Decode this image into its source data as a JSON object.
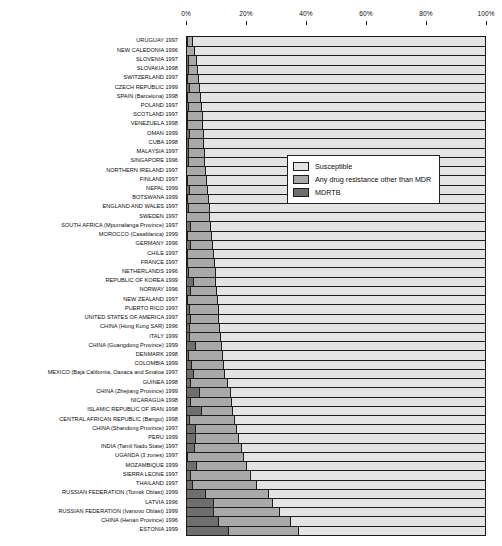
{
  "chart_data": {
    "type": "bar",
    "subtype": "horizontal-stacked-100-percent",
    "title": "",
    "xlabel": "",
    "ylabel": "",
    "xlim": [
      0,
      100
    ],
    "xticks": [
      "0%",
      "20%",
      "40%",
      "60%",
      "80%",
      "100%"
    ],
    "xtick_values": [
      0,
      20,
      40,
      60,
      80,
      100
    ],
    "grid": false,
    "legend_position": "upper-center",
    "series": [
      {
        "name": "Susceptible",
        "color": "#e4e4e4"
      },
      {
        "name": "Any drug resistance other than MDR",
        "color": "#a9a9a9"
      },
      {
        "name": "MDRTB",
        "color": "#6e6e6e"
      }
    ],
    "categories": [
      "URUGUAY 1997",
      "NEW CALEDONIA 1996",
      "SLOVENIA 1997",
      "SLOVAKIA 1998",
      "SWITZERLAND 1997",
      "CZECH REPUBLIC 1999",
      "SPAIN (Barcelona) 1998",
      "POLAND 1997",
      "SCOTLAND 1997",
      "VENEZUELA 1998",
      "OMAN 1999",
      "CUBA 1998",
      "MALAYSIA 1997",
      "SINGAPORE 1996",
      "NORTHERN IRELAND 1997",
      "FINLAND 1997",
      "NEPAL 1999",
      "BOTSWANA 1999",
      "ENGLAND AND WALES 1997",
      "SWEDEN 1997",
      "SOUTH AFRICA (Mpumalanga Province) 1997",
      "MOROCCO (Casablanca) 1999",
      "GERMANY 1996",
      "CHILE 1997",
      "FRANCE 1997",
      "NETHERLANDS 1996",
      "REPUBLIC OF KOREA 1999",
      "NORWAY 1996",
      "NEW ZEALAND 1997",
      "PUERTO RICO 1997",
      "UNITED STATES OF AMERICA 1997",
      "CHINA (Hong Kong SAR) 1996",
      "ITALY 1999",
      "CHINA (Guangdong Province) 1999",
      "DENMARK 1998",
      "COLOMBIA 1999",
      "MEXICO (Baja California, Oaxaca and Sinaloa 1997",
      "GUINEA 1998",
      "CHINA (Zhejiang Province) 1999",
      "NICARAGUA 1998",
      "ISLAMIC REPUBLIC OF IRAN 1998",
      "CENTRAL AFRICAN REPUBLIC (Bangui) 1998",
      "CHINA (Shandong Province) 1997",
      "PERU 1999",
      "INDIA (Tamil Nadu State) 1997",
      "UGANDA (3 zones) 1997",
      "MOZAMBIQUE 1999",
      "SIERRA LEONE 1997",
      "THAILAND 1997",
      "RUSSIAN FEDERATION (Tomsk Oblast) 1999",
      "LATVIA 1996",
      "RUSSIAN FEDERATION (Ivanovo Oblast) 1999",
      "CHINA (Henan Province) 1996",
      "ESTONIA 1999"
    ],
    "rows": [
      {
        "category": "URUGUAY 1997",
        "mdr": 0.4,
        "other": 1.6,
        "susceptible": 98.0
      },
      {
        "category": "NEW CALEDONIA 1996",
        "mdr": 0.0,
        "other": 2.6,
        "susceptible": 97.4
      },
      {
        "category": "SLOVENIA 1997",
        "mdr": 0.7,
        "other": 2.6,
        "susceptible": 96.7
      },
      {
        "category": "SLOVAKIA 1998",
        "mdr": 0.6,
        "other": 3.2,
        "susceptible": 96.2
      },
      {
        "category": "SWITZERLAND 1997",
        "mdr": 0.4,
        "other": 3.6,
        "susceptible": 96.0
      },
      {
        "category": "CZECH REPUBLIC 1999",
        "mdr": 1.0,
        "other": 3.3,
        "susceptible": 95.7
      },
      {
        "category": "SPAIN (Barcelona) 1998",
        "mdr": 0.5,
        "other": 4.2,
        "susceptible": 95.3
      },
      {
        "category": "POLAND 1997",
        "mdr": 0.6,
        "other": 4.5,
        "susceptible": 94.9
      },
      {
        "category": "SCOTLAND 1997",
        "mdr": 0.3,
        "other": 5.0,
        "susceptible": 94.7
      },
      {
        "category": "VENEZUELA 1998",
        "mdr": 0.5,
        "other": 5.0,
        "susceptible": 94.5
      },
      {
        "category": "OMAN 1999",
        "mdr": 1.1,
        "other": 4.5,
        "susceptible": 94.4
      },
      {
        "category": "CUBA 1998",
        "mdr": 0.7,
        "other": 5.1,
        "susceptible": 94.2
      },
      {
        "category": "MALAYSIA 1997",
        "mdr": 0.6,
        "other": 5.4,
        "susceptible": 94.0
      },
      {
        "category": "SINGAPORE 1996",
        "mdr": 0.8,
        "other": 5.4,
        "susceptible": 93.8
      },
      {
        "category": "NORTHERN IRELAND 1997",
        "mdr": 0.0,
        "other": 6.4,
        "susceptible": 93.6
      },
      {
        "category": "FINLAND 1997",
        "mdr": 0.4,
        "other": 6.2,
        "susceptible": 93.4
      },
      {
        "category": "NEPAL 1999",
        "mdr": 1.1,
        "other": 6.0,
        "susceptible": 92.9
      },
      {
        "category": "BOTSWANA 1999",
        "mdr": 0.4,
        "other": 7.0,
        "susceptible": 92.6
      },
      {
        "category": "ENGLAND AND WALES 1997",
        "mdr": 0.8,
        "other": 6.8,
        "susceptible": 92.4
      },
      {
        "category": "SWEDEN 1997",
        "mdr": 0.0,
        "other": 7.8,
        "susceptible": 92.2
      },
      {
        "category": "SOUTH AFRICA (Mpumalanga Province) 1997",
        "mdr": 1.5,
        "other": 6.7,
        "susceptible": 91.8
      },
      {
        "category": "MOROCCO (Casablanca) 1999",
        "mdr": 0.5,
        "other": 8.0,
        "susceptible": 91.5
      },
      {
        "category": "GERMANY 1996",
        "mdr": 1.3,
        "other": 7.5,
        "susceptible": 91.2
      },
      {
        "category": "CHILE 1997",
        "mdr": 0.4,
        "other": 8.6,
        "susceptible": 91.0
      },
      {
        "category": "FRANCE 1997",
        "mdr": 0.5,
        "other": 8.8,
        "susceptible": 90.7
      },
      {
        "category": "NETHERLANDS 1996",
        "mdr": 0.6,
        "other": 9.0,
        "susceptible": 90.4
      },
      {
        "category": "REPUBLIC OF KOREA 1999",
        "mdr": 2.2,
        "other": 7.6,
        "susceptible": 90.2
      },
      {
        "category": "NORWAY 1996",
        "mdr": 1.4,
        "other": 8.8,
        "susceptible": 89.8
      },
      {
        "category": "NEW ZEALAND 1997",
        "mdr": 0.3,
        "other": 10.1,
        "susceptible": 89.6
      },
      {
        "category": "PUERTO RICO 1997",
        "mdr": 1.1,
        "other": 9.5,
        "susceptible": 89.4
      },
      {
        "category": "UNITED STATES OF AMERICA 1997",
        "mdr": 1.2,
        "other": 9.7,
        "susceptible": 89.1
      },
      {
        "category": "CHINA (Hong Kong SAR) 1996",
        "mdr": 0.9,
        "other": 10.3,
        "susceptible": 88.8
      },
      {
        "category": "ITALY 1999",
        "mdr": 1.0,
        "other": 10.5,
        "susceptible": 88.5
      },
      {
        "category": "CHINA (Guangdong Province) 1999",
        "mdr": 2.9,
        "other": 8.9,
        "susceptible": 88.2
      },
      {
        "category": "DENMARK 1998",
        "mdr": 0.8,
        "other": 11.4,
        "susceptible": 87.8
      },
      {
        "category": "COLOMBIA 1999",
        "mdr": 1.8,
        "other": 10.7,
        "susceptible": 87.5
      },
      {
        "category": "MEXICO (Baja California, Oaxaca and Sinaloa 1997",
        "mdr": 2.4,
        "other": 10.4,
        "susceptible": 87.2
      },
      {
        "category": "GUINEA 1998",
        "mdr": 1.4,
        "other": 12.4,
        "susceptible": 86.2
      },
      {
        "category": "CHINA (Zhejiang Province) 1999",
        "mdr": 4.5,
        "other": 10.4,
        "susceptible": 85.1
      },
      {
        "category": "NICARAGUA 1998",
        "mdr": 1.3,
        "other": 13.8,
        "susceptible": 84.9
      },
      {
        "category": "ISLAMIC REPUBLIC OF IRAN 1998",
        "mdr": 5.0,
        "other": 10.5,
        "susceptible": 84.5
      },
      {
        "category": "CENTRAL AFRICAN REPUBLIC (Bangui) 1998",
        "mdr": 1.0,
        "other": 15.2,
        "susceptible": 83.8
      },
      {
        "category": "CHINA (Shandong Province) 1997",
        "mdr": 3.1,
        "other": 13.6,
        "susceptible": 83.3
      },
      {
        "category": "PERU 1999",
        "mdr": 3.0,
        "other": 14.6,
        "susceptible": 82.4
      },
      {
        "category": "INDIA (Tamil Nadu State) 1997",
        "mdr": 2.6,
        "other": 15.9,
        "susceptible": 81.5
      },
      {
        "category": "UGANDA (3 zones) 1997",
        "mdr": 0.5,
        "other": 18.7,
        "susceptible": 80.8
      },
      {
        "category": "MOZAMBIQUE 1999",
        "mdr": 3.5,
        "other": 16.6,
        "susceptible": 79.9
      },
      {
        "category": "SIERRA LEONE 1997",
        "mdr": 1.4,
        "other": 20.1,
        "susceptible": 78.5
      },
      {
        "category": "THAILAND 1997",
        "mdr": 2.0,
        "other": 21.4,
        "susceptible": 76.6
      },
      {
        "category": "RUSSIAN FEDERATION (Tomsk Oblast) 1999",
        "mdr": 6.5,
        "other": 21.0,
        "susceptible": 72.5
      },
      {
        "category": "LATVIA 1996",
        "mdr": 9.0,
        "other": 20.0,
        "susceptible": 71.0
      },
      {
        "category": "RUSSIAN FEDERATION (Ivanovo Oblast) 1999",
        "mdr": 9.0,
        "other": 22.3,
        "susceptible": 68.7
      },
      {
        "category": "CHINA (Henan Province) 1996",
        "mdr": 10.8,
        "other": 24.0,
        "susceptible": 65.2
      },
      {
        "category": "ESTONIA 1999",
        "mdr": 14.1,
        "other": 23.4,
        "susceptible": 62.5
      }
    ]
  },
  "legend": {
    "items": [
      {
        "label": "Susceptible",
        "color": "#e4e4e4"
      },
      {
        "label": "Any drug resistance other than MDR",
        "color": "#a9a9a9"
      },
      {
        "label": "MDRTB",
        "color": "#6e6e6e"
      }
    ]
  }
}
